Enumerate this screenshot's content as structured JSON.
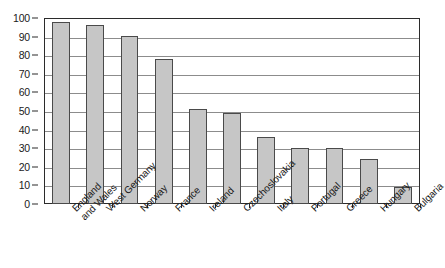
{
  "chart_data": {
    "type": "bar",
    "title": "",
    "subtitle": "",
    "xlabel": "",
    "ylabel": "",
    "ylim": [
      0,
      100
    ],
    "ytick_step": 10,
    "yticks": [
      0,
      10,
      20,
      30,
      40,
      50,
      60,
      70,
      80,
      90,
      100
    ],
    "grid": true,
    "legend": false,
    "categories": [
      "England and Wales",
      "West Germany",
      "Norway",
      "France",
      "Ireland",
      "Czechoslovakia",
      "Italy",
      "Portugal",
      "Greece",
      "Hungary",
      "Bulgaria"
    ],
    "category_lines": [
      [
        "England",
        "and Wales"
      ],
      [
        "West Germany"
      ],
      [
        "Norway"
      ],
      [
        "France"
      ],
      [
        "Ireland"
      ],
      [
        "Czechoslovakia"
      ],
      [
        "Italy"
      ],
      [
        "Portugal"
      ],
      [
        "Greece"
      ],
      [
        "Hungary"
      ],
      [
        "Bulgaria"
      ]
    ],
    "values": [
      98,
      96,
      90.5,
      78,
      51,
      49,
      36,
      30,
      30,
      24,
      9
    ],
    "bar_fill_color": "#c6c6c6",
    "bar_edge_color": "#4a4a4a",
    "grid_color": "#8c8c8c",
    "frame_color": "#2b2b2b"
  }
}
